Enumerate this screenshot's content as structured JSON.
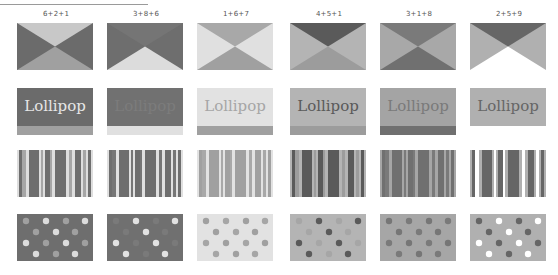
{
  "cards": [
    {
      "label": "6+2+1",
      "triangles": {
        "sides": "#6b6b6b",
        "top": "#c8c8c8",
        "bottom": "#a0a0a0"
      },
      "lollipop": {
        "text": "Lollipop",
        "bg": "#6b6b6b",
        "fg": "#e6e6e6",
        "bar": "#a0a0a0"
      },
      "stripes": {
        "base": "#dedede",
        "dark": "#6e6e6e",
        "mid": "#a6a6a6"
      },
      "dots": {
        "bg": "#6e6e6e",
        "a": "#dcdcdc",
        "b": "#a0a0a0"
      }
    },
    {
      "label": "3+8+6",
      "triangles": {
        "sides": "#6e6e6e",
        "top": "#757575",
        "bottom": "#dcdcdc"
      },
      "lollipop": {
        "text": "Lollipop",
        "bg": "#717171",
        "fg": "#7c7c7c",
        "bar": "#e0e0e0"
      },
      "stripes": {
        "base": "#e0e0e0",
        "dark": "#6e6e6e",
        "mid": "#767676"
      },
      "dots": {
        "bg": "#707070",
        "a": "#e2e2e2",
        "b": "#7a7a7a"
      }
    },
    {
      "label": "1+6+7",
      "triangles": {
        "sides": "#e0e0e0",
        "top": "#a8a8a8",
        "bottom": "#a0a0a0"
      },
      "lollipop": {
        "text": "Lollipop",
        "bg": "#e2e2e2",
        "fg": "#a6a6a6",
        "bar": "#a0a0a0"
      },
      "stripes": {
        "base": "#e2e2e2",
        "dark": "#a0a0a0",
        "mid": "#a8a8a8"
      },
      "dots": {
        "bg": "#e2e2e2",
        "a": "#a6a6a6",
        "b": "#a0a0a0"
      }
    },
    {
      "label": "4+5+1",
      "triangles": {
        "sides": "#b4b4b4",
        "top": "#5a5a5a",
        "bottom": "#9c9c9c"
      },
      "lollipop": {
        "text": "Lollipop",
        "bg": "#b4b4b4",
        "fg": "#5a5a5a",
        "bar": "#9c9c9c"
      },
      "stripes": {
        "base": "#b4b4b4",
        "dark": "#5a5a5a",
        "mid": "#9c9c9c"
      },
      "dots": {
        "bg": "#b4b4b4",
        "a": "#5a5a5a",
        "b": "#a6a6a6"
      }
    },
    {
      "label": "3+1+8",
      "triangles": {
        "sides": "#a8a8a8",
        "top": "#7a7a7a",
        "bottom": "#707070"
      },
      "lollipop": {
        "text": "Lollipop",
        "bg": "#a4a4a4",
        "fg": "#7a7a7a",
        "bar": "#707070"
      },
      "stripes": {
        "base": "#a6a6a6",
        "dark": "#707070",
        "mid": "#7a7a7a"
      },
      "dots": {
        "bg": "#a6a6a6",
        "a": "#7a7a7a",
        "b": "#767676"
      }
    },
    {
      "label": "2+5+9",
      "triangles": {
        "sides": "#b0b0b0",
        "top": "#666666",
        "bottom": "#ffffff"
      },
      "lollipop": {
        "text": "Lollipop",
        "bg": "#b0b0b0",
        "fg": "#666666",
        "bar": "#ffffff"
      },
      "stripes": {
        "base": "#b0b0b0",
        "dark": "#666666",
        "mid": "#ffffff"
      },
      "dots": {
        "bg": "#b0b0b0",
        "a": "#ffffff",
        "b": "#666666"
      }
    }
  ]
}
